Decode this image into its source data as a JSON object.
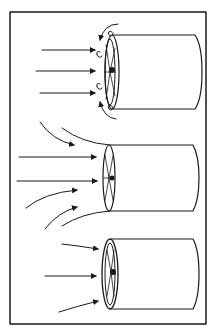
{
  "diagram": {
    "title": "",
    "panels": [
      {
        "id": "top",
        "label": "",
        "inflow": "straight arrows with vortices at duct lip"
      },
      {
        "id": "middle",
        "label": "",
        "inflow": "straight and converging curved arrows with flared inlet"
      },
      {
        "id": "bottom",
        "label": "",
        "inflow": "converging arrows into rimmed inlet"
      }
    ],
    "colors": {
      "ink": "#1a1a1a",
      "background": "#ffffff"
    }
  }
}
